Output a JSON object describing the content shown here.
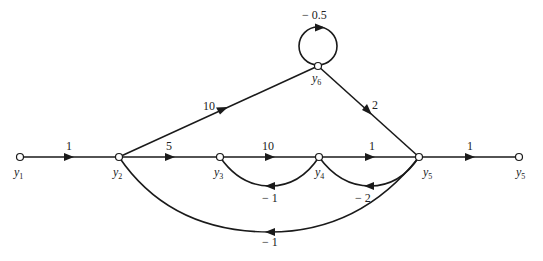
{
  "diagram": {
    "type": "signal-flow-graph",
    "nodes": [
      {
        "id": "y1",
        "label": "y",
        "sub": "1"
      },
      {
        "id": "y2",
        "label": "y",
        "sub": "2"
      },
      {
        "id": "y3",
        "label": "y",
        "sub": "3"
      },
      {
        "id": "y4",
        "label": "y",
        "sub": "4"
      },
      {
        "id": "y5",
        "label": "y",
        "sub": "5"
      },
      {
        "id": "y5out",
        "label": "y",
        "sub": "5"
      },
      {
        "id": "y6",
        "label": "y",
        "sub": "6"
      }
    ],
    "edges": [
      {
        "from": "y1",
        "to": "y2",
        "gain": "1"
      },
      {
        "from": "y2",
        "to": "y3",
        "gain": "5"
      },
      {
        "from": "y3",
        "to": "y4",
        "gain": "10"
      },
      {
        "from": "y4",
        "to": "y5",
        "gain": "1"
      },
      {
        "from": "y5",
        "to": "y5out",
        "gain": "1"
      },
      {
        "from": "y2",
        "to": "y6",
        "gain": "10"
      },
      {
        "from": "y6",
        "to": "y5",
        "gain": "2"
      },
      {
        "from": "y6",
        "to": "y6",
        "gain": "− 0.5"
      },
      {
        "from": "y4",
        "to": "y3",
        "gain": "− 1"
      },
      {
        "from": "y5",
        "to": "y4",
        "gain": "− 2"
      },
      {
        "from": "y5",
        "to": "y2",
        "gain": "− 1"
      }
    ]
  }
}
